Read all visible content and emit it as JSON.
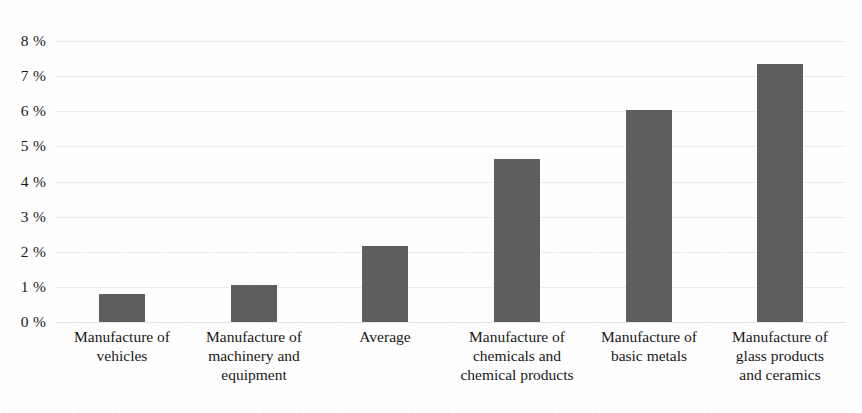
{
  "chart_data": {
    "type": "bar",
    "title": "",
    "subtitle": "",
    "xlabel": "",
    "ylabel": "",
    "ylim": [
      0,
      8
    ],
    "y_tick_step": 1,
    "grid": true,
    "legend": "none",
    "orientation": "vertical",
    "value_unit": "%",
    "bar_color": "#5e5e5e",
    "background_color": "#ffffff",
    "gridline_color": "#ececec",
    "categories": [
      "Manufacture of vehicles",
      "Manufacture of machinery and equipment",
      "Average",
      "Manufacture of chemicals and chemical products",
      "Manufacture of basic metals",
      "Manufacture of glass products and ceramics"
    ],
    "category_lines": [
      [
        "Manufacture of",
        "vehicles"
      ],
      [
        "Manufacture of",
        "machinery and",
        "equipment"
      ],
      [
        "Average"
      ],
      [
        "Manufacture of",
        "chemicals and",
        "chemical products"
      ],
      [
        "Manufacture of",
        "basic metals"
      ],
      [
        "Manufacture of",
        "glass products",
        "and ceramics"
      ]
    ],
    "values": [
      0.8,
      1.05,
      2.15,
      4.65,
      6.05,
      7.35
    ],
    "y_tick_labels": [
      "8 %",
      "7 %",
      "6 %",
      "5 %",
      "4 %",
      "3 %",
      "2 %",
      "1 %",
      "0 %"
    ],
    "y_tick_values": [
      8,
      7,
      6,
      5,
      4,
      3,
      2,
      1,
      0
    ]
  }
}
